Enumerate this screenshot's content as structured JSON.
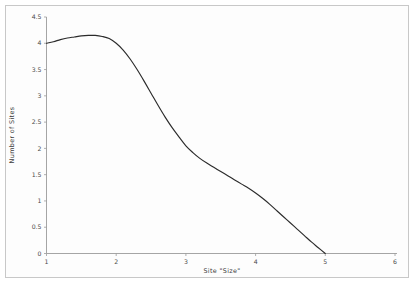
{
  "chart_data": {
    "type": "line",
    "title": "",
    "xlabel": "Site \"Size\"",
    "ylabel": "Number of Sites",
    "xlim": [
      1,
      6
    ],
    "ylim": [
      0,
      4.5
    ],
    "grid": false,
    "legend": null,
    "xticks": [
      "1",
      "2",
      "3",
      "4",
      "5",
      "6"
    ],
    "xtick_values": [
      1,
      2,
      3,
      4,
      5,
      6
    ],
    "yticks": [
      "0",
      "0.5",
      "1",
      "1.5",
      "2",
      "2.5",
      "3",
      "3.5",
      "4",
      "4.5"
    ],
    "ytick_values": [
      0,
      0.5,
      1,
      1.5,
      2,
      2.5,
      3,
      3.5,
      4,
      4.5
    ],
    "series": [
      {
        "name": "Number of Sites",
        "color": "#2b2b2b",
        "x": [
          1.0,
          1.1,
          1.2,
          1.3,
          1.4,
          1.5,
          1.6,
          1.7,
          1.8,
          1.9,
          2.0,
          2.1,
          2.2,
          2.3,
          2.4,
          2.5,
          2.6,
          2.7,
          2.8,
          2.9,
          3.0,
          3.1,
          3.2,
          3.3,
          3.4,
          3.5,
          3.6,
          3.7,
          3.8,
          3.9,
          4.0,
          4.1,
          4.2,
          4.3,
          4.4,
          4.5,
          4.6,
          4.7,
          4.8,
          4.9,
          5.0
        ],
        "y": [
          4.0,
          4.03,
          4.07,
          4.1,
          4.12,
          4.14,
          4.15,
          4.15,
          4.13,
          4.09,
          4.0,
          3.87,
          3.7,
          3.5,
          3.28,
          3.05,
          2.82,
          2.6,
          2.4,
          2.22,
          2.05,
          1.92,
          1.81,
          1.72,
          1.64,
          1.56,
          1.48,
          1.4,
          1.32,
          1.24,
          1.15,
          1.05,
          0.94,
          0.82,
          0.7,
          0.58,
          0.46,
          0.34,
          0.22,
          0.11,
          0.0
        ]
      }
    ]
  },
  "axes": {
    "x_axis_label": "Site \"Size\"",
    "y_axis_label": "Number of Sites"
  }
}
